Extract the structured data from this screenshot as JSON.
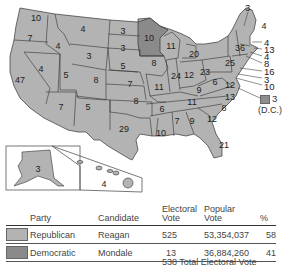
{
  "colors": {
    "republican": "#b3b3b3",
    "democratic": "#8a8a8a",
    "state_border": "#333333",
    "background": "#ffffff"
  },
  "map": {
    "states": [
      {
        "state": "WA",
        "ev": "10",
        "winner": "R"
      },
      {
        "state": "OR",
        "ev": "7",
        "winner": "R"
      },
      {
        "state": "CA",
        "ev": "47",
        "winner": "R"
      },
      {
        "state": "ID",
        "ev": "4",
        "winner": "R"
      },
      {
        "state": "NV",
        "ev": "4",
        "winner": "R"
      },
      {
        "state": "MT",
        "ev": "4",
        "winner": "R"
      },
      {
        "state": "WY",
        "ev": "3",
        "winner": "R"
      },
      {
        "state": "UT",
        "ev": "5",
        "winner": "R"
      },
      {
        "state": "AZ",
        "ev": "7",
        "winner": "R"
      },
      {
        "state": "CO",
        "ev": "8",
        "winner": "R"
      },
      {
        "state": "NM",
        "ev": "5",
        "winner": "R"
      },
      {
        "state": "ND",
        "ev": "3",
        "winner": "R"
      },
      {
        "state": "SD",
        "ev": "3",
        "winner": "R"
      },
      {
        "state": "NE",
        "ev": "5",
        "winner": "R"
      },
      {
        "state": "KS",
        "ev": "7",
        "winner": "R"
      },
      {
        "state": "OK",
        "ev": "8",
        "winner": "R"
      },
      {
        "state": "TX",
        "ev": "29",
        "winner": "R"
      },
      {
        "state": "MN",
        "ev": "10",
        "winner": "D"
      },
      {
        "state": "IA",
        "ev": "8",
        "winner": "R"
      },
      {
        "state": "MO",
        "ev": "11",
        "winner": "R"
      },
      {
        "state": "AR",
        "ev": "6",
        "winner": "R"
      },
      {
        "state": "LA",
        "ev": "10",
        "winner": "R"
      },
      {
        "state": "WI",
        "ev": "11",
        "winner": "R"
      },
      {
        "state": "IL",
        "ev": "24",
        "winner": "R"
      },
      {
        "state": "MI",
        "ev": "20",
        "winner": "R"
      },
      {
        "state": "IN",
        "ev": "12",
        "winner": "R"
      },
      {
        "state": "OH",
        "ev": "23",
        "winner": "R"
      },
      {
        "state": "KY",
        "ev": "9",
        "winner": "R"
      },
      {
        "state": "TN",
        "ev": "11",
        "winner": "R"
      },
      {
        "state": "MS",
        "ev": "7",
        "winner": "R"
      },
      {
        "state": "AL",
        "ev": "9",
        "winner": "R"
      },
      {
        "state": "GA",
        "ev": "12",
        "winner": "R"
      },
      {
        "state": "FL",
        "ev": "21",
        "winner": "R"
      },
      {
        "state": "SC",
        "ev": "8",
        "winner": "R"
      },
      {
        "state": "NC",
        "ev": "13",
        "winner": "R"
      },
      {
        "state": "VA",
        "ev": "12",
        "winner": "R"
      },
      {
        "state": "WV",
        "ev": "6",
        "winner": "R"
      },
      {
        "state": "PA",
        "ev": "25",
        "winner": "R"
      },
      {
        "state": "NY",
        "ev": "36",
        "winner": "R"
      },
      {
        "state": "VT",
        "ev": "3",
        "winner": "R"
      },
      {
        "state": "NH",
        "ev": "4",
        "winner": "R"
      },
      {
        "state": "ME",
        "ev": "4",
        "winner": "R"
      },
      {
        "state": "MA",
        "ev": "13",
        "winner": "R"
      },
      {
        "state": "RI",
        "ev": "4",
        "winner": "R"
      },
      {
        "state": "CT",
        "ev": "8",
        "winner": "R"
      },
      {
        "state": "NJ",
        "ev": "16",
        "winner": "R"
      },
      {
        "state": "DE",
        "ev": "3",
        "winner": "R"
      },
      {
        "state": "MD",
        "ev": "10",
        "winner": "R"
      },
      {
        "state": "AK",
        "ev": "3",
        "winner": "R"
      },
      {
        "state": "HI",
        "ev": "4",
        "winner": "R"
      }
    ],
    "dc": {
      "ev": "3",
      "label": "(D.C.)",
      "winner": "D"
    }
  },
  "table": {
    "headers": {
      "party": "Party",
      "candidate": "Candidate",
      "electoral": "Electoral\nVote",
      "electoral_l1": "Electoral",
      "electoral_l2": "Vote",
      "popular_l1": "Popular",
      "popular_l2": "Vote",
      "pct": "%"
    },
    "rows": [
      {
        "party": "Republican",
        "candidate": "Reagan",
        "electoral": "525",
        "popular": "53,354,037",
        "pct": "58"
      },
      {
        "party": "Democratic",
        "candidate": "Mondale",
        "electoral": "13",
        "popular": "36,884,260",
        "pct": "41"
      }
    ],
    "total": "538 Total Electoral Vote"
  }
}
